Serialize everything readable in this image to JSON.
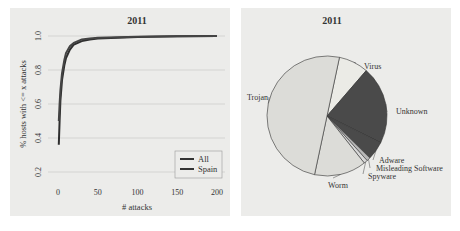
{
  "chart_data": [
    {
      "type": "line",
      "title": "2011",
      "xlabel": "# attacks",
      "ylabel": "% hosts with <= x attacks",
      "xlim": [
        0,
        200
      ],
      "ylim": [
        0.2,
        1.0
      ],
      "x_ticks": [
        "0",
        "50",
        "100",
        "150",
        "200"
      ],
      "y_ticks": [
        "0.2",
        "0.4",
        "0.6",
        "0.8",
        "1.0"
      ],
      "grid": true,
      "legend_position": "bottom-right",
      "series": [
        {
          "name": "All",
          "x": [
            1,
            2,
            3,
            5,
            8,
            10,
            15,
            20,
            30,
            40,
            50,
            75,
            100,
            150,
            200
          ],
          "values": [
            0.36,
            0.5,
            0.62,
            0.74,
            0.83,
            0.87,
            0.92,
            0.95,
            0.97,
            0.98,
            0.985,
            0.99,
            0.995,
            0.998,
            1.0
          ]
        },
        {
          "name": "Spain",
          "x": [
            1,
            2,
            3,
            5,
            8,
            10,
            15,
            20,
            30,
            40,
            50,
            75,
            100,
            150,
            200
          ],
          "values": [
            0.5,
            0.6,
            0.68,
            0.78,
            0.86,
            0.9,
            0.94,
            0.96,
            0.98,
            0.985,
            0.99,
            0.993,
            0.996,
            0.999,
            1.0
          ]
        }
      ]
    },
    {
      "type": "pie",
      "title": "2011",
      "categories": [
        "Virus",
        "Unknown",
        "Adware",
        "Misleading Software",
        "Spyware",
        "Worm",
        "Trojan"
      ],
      "values": [
        8,
        21,
        5,
        1,
        1,
        14,
        50
      ],
      "colors": [
        "#ebebe6",
        "#4a4a4a",
        "#4a4a4a",
        "#b8b8b8",
        "#d8d8d8",
        "#dcdcd8",
        "#dcdcd8"
      ]
    }
  ],
  "left": {
    "title": "2011",
    "xlabel": "# attacks",
    "ylabel": "% hosts with <= x attacks",
    "legend": [
      "All",
      "Spain"
    ]
  },
  "right": {
    "title": "2011"
  }
}
